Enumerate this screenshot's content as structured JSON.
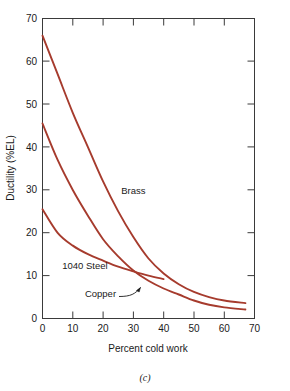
{
  "figure": {
    "caption": "(c)",
    "background_color": "#ffffff",
    "curve_color": "#a63b2d",
    "axis_color": "#3a3a3a",
    "text_color": "#1a1a1a"
  },
  "chart_data": {
    "type": "line",
    "title": "",
    "xlabel": "Percent cold work",
    "ylabel": "Ductility (%EL)",
    "xlim": [
      0,
      70
    ],
    "ylim": [
      0,
      70
    ],
    "xticks": [
      0,
      10,
      20,
      30,
      40,
      50,
      60,
      70
    ],
    "xticklabels": [
      "0",
      "10",
      "20",
      "30",
      "40",
      "50",
      "60",
      "70"
    ],
    "yticks": [
      0,
      10,
      20,
      30,
      40,
      50,
      60,
      70
    ],
    "yticklabels": [
      "0",
      "10",
      "20",
      "30",
      "40",
      "50",
      "60",
      "70"
    ],
    "grid": false,
    "legend_position": "inline-annotations",
    "series": [
      {
        "name": "Brass",
        "color": "#a63b2d",
        "label_x": 26,
        "label_y": 29,
        "x": [
          0,
          5,
          10,
          15,
          20,
          25,
          30,
          35,
          40,
          45,
          50,
          55,
          60,
          67
        ],
        "y": [
          66,
          57,
          48,
          40,
          32,
          25,
          19,
          14,
          10.5,
          8,
          6.2,
          5.0,
          4.2,
          3.6
        ]
      },
      {
        "name": "1040 Steel",
        "color": "#a63b2d",
        "label_x": 6.5,
        "label_y": 11.5,
        "x": [
          0,
          5,
          10,
          15,
          20,
          25,
          30,
          35,
          40,
          45,
          50,
          55,
          60,
          67
        ],
        "y": [
          45.5,
          37,
          30,
          24,
          18.5,
          14.5,
          11.2,
          8.8,
          7.0,
          5.6,
          4.2,
          3.2,
          2.6,
          2.1
        ]
      },
      {
        "name": "Copper",
        "color": "#a63b2d",
        "label_x": 14,
        "label_y": 5,
        "x": [
          0,
          5,
          10,
          15,
          20,
          25,
          30,
          35,
          40
        ],
        "y": [
          25.5,
          20.0,
          17.0,
          15.0,
          13.5,
          12.1,
          11.0,
          10.0,
          9.2
        ]
      }
    ],
    "annotations": [
      {
        "text": "Brass",
        "target_series": "Brass",
        "kind": "inline-label"
      },
      {
        "text": "1040 Steel",
        "target_series": "1040 Steel",
        "kind": "inline-label"
      },
      {
        "text": "Copper",
        "target_series": "Copper",
        "kind": "leader-arrow-label"
      }
    ]
  }
}
